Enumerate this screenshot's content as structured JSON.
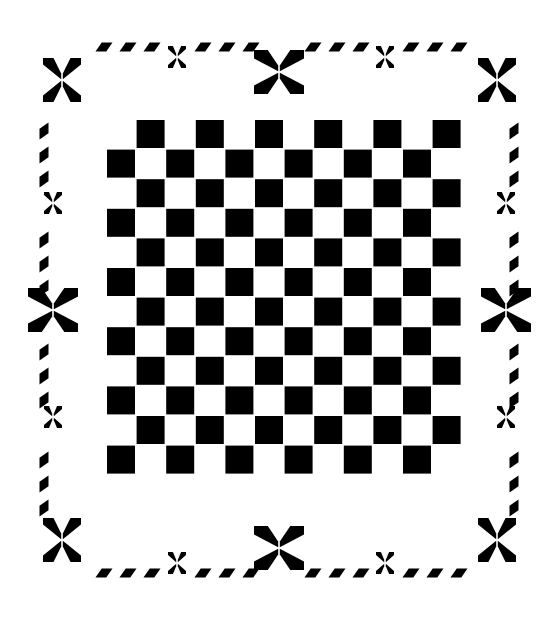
{
  "artwork": {
    "title": "Checkerboard quilt block with star border",
    "medium": "two-tone graphic pattern",
    "canvas": {
      "width": 558,
      "height": 617
    },
    "colors": {
      "ink": "#000000",
      "ground": "#ffffff"
    }
  },
  "checkerboard": {
    "name": "checkerboard-field",
    "rows": 12,
    "cols": 12,
    "origin_x": 107,
    "origin_y": 120,
    "cell": 29.6,
    "square": 28,
    "parity": 1,
    "description": "12 by 12 alternating black and white squares with thin white separations"
  },
  "border": {
    "name": "decorative-border-frame",
    "petal": {
      "large_half_w": 19,
      "large_half_h": 13,
      "small_half_w": 9,
      "small_half_h": 7,
      "dash_w": 17,
      "dash_h": 9,
      "skew": 0.55
    },
    "corner_stars": [
      {
        "id": "corner-star-top-left",
        "x": 62,
        "y": 80
      },
      {
        "id": "corner-star-top-right",
        "x": 497,
        "y": 80
      },
      {
        "id": "corner-star-bottom-left",
        "x": 62,
        "y": 540
      },
      {
        "id": "corner-star-bottom-right",
        "x": 497,
        "y": 540
      }
    ],
    "mid_stars": [
      {
        "id": "mid-star-top",
        "x": 279,
        "y": 72
      },
      {
        "id": "mid-star-bottom",
        "x": 279,
        "y": 548
      },
      {
        "id": "mid-star-left",
        "x": 53,
        "y": 310
      },
      {
        "id": "mid-star-right",
        "x": 506,
        "y": 310
      }
    ],
    "small_stars": [
      {
        "id": "small-star-top-a",
        "x": 177,
        "y": 57
      },
      {
        "id": "small-star-top-b",
        "x": 385,
        "y": 57
      },
      {
        "id": "small-star-bottom-a",
        "x": 177,
        "y": 563
      },
      {
        "id": "small-star-bottom-b",
        "x": 385,
        "y": 563
      },
      {
        "id": "small-star-left-a",
        "x": 53,
        "y": 203
      },
      {
        "id": "small-star-left-b",
        "x": 53,
        "y": 417
      },
      {
        "id": "small-star-right-a",
        "x": 506,
        "y": 203
      },
      {
        "id": "small-star-right-b",
        "x": 506,
        "y": 417
      }
    ],
    "dash_runs": [
      {
        "id": "dash-run-top-left",
        "axis": "h",
        "x0": 104,
        "y": 47,
        "count": 3,
        "step": 24
      },
      {
        "id": "dash-run-top-mid-left",
        "axis": "h",
        "x0": 203,
        "y": 47,
        "count": 3,
        "step": 24
      },
      {
        "id": "dash-run-top-mid-right",
        "axis": "h",
        "x0": 313,
        "y": 47,
        "count": 3,
        "step": 24
      },
      {
        "id": "dash-run-top-right",
        "axis": "h",
        "x0": 411,
        "y": 47,
        "count": 3,
        "step": 24
      },
      {
        "id": "dash-run-bottom-left",
        "axis": "h",
        "x0": 104,
        "y": 573,
        "count": 3,
        "step": 24
      },
      {
        "id": "dash-run-bottom-mid-left",
        "axis": "h",
        "x0": 203,
        "y": 573,
        "count": 3,
        "step": 24
      },
      {
        "id": "dash-run-bottom-mid-right",
        "axis": "h",
        "x0": 313,
        "y": 573,
        "count": 3,
        "step": 24
      },
      {
        "id": "dash-run-bottom-right",
        "axis": "h",
        "x0": 411,
        "y": 573,
        "count": 3,
        "step": 24
      },
      {
        "id": "dash-run-left-upper",
        "axis": "v",
        "x": 44,
        "y0": 131,
        "count": 3,
        "step": 24
      },
      {
        "id": "dash-run-left-mid",
        "axis": "v",
        "x": 44,
        "y0": 240,
        "count": 3,
        "step": 24
      },
      {
        "id": "dash-run-left-lower",
        "axis": "v",
        "x": 44,
        "y0": 352,
        "count": 3,
        "step": 24
      },
      {
        "id": "dash-run-left-bottom",
        "axis": "v",
        "x": 44,
        "y0": 460,
        "count": 3,
        "step": 24
      },
      {
        "id": "dash-run-right-upper",
        "axis": "v",
        "x": 514,
        "y0": 131,
        "count": 3,
        "step": 24
      },
      {
        "id": "dash-run-right-mid",
        "axis": "v",
        "x": 514,
        "y0": 240,
        "count": 3,
        "step": 24
      },
      {
        "id": "dash-run-right-lower",
        "axis": "v",
        "x": 514,
        "y0": 352,
        "count": 3,
        "step": 24
      },
      {
        "id": "dash-run-right-bottom",
        "axis": "v",
        "x": 514,
        "y0": 460,
        "count": 3,
        "step": 24
      }
    ]
  }
}
